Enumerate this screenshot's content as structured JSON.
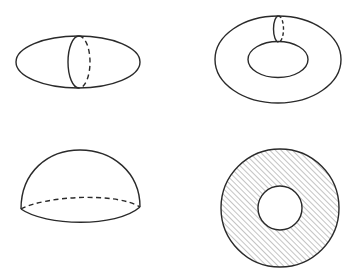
{
  "figure": {
    "background": "#ffffff",
    "line_color": "#2a2a2a",
    "hatch_color": "#8a8a8a",
    "panels": [
      {
        "id": "ellipsoid",
        "label": "ellipsoid",
        "outer_ellipse": {
          "cx": 78,
          "cy": 62,
          "rx": 62,
          "ry": 26
        },
        "meridian": {
          "cx": 79,
          "cy": 62,
          "rx": 11,
          "ry": 26,
          "front": "solid-left",
          "back": "dashed-right"
        }
      },
      {
        "id": "torus",
        "label": "torus",
        "outer_ellipse": {
          "cx": 278,
          "cy": 59.5,
          "rx": 63,
          "ry": 43.5
        },
        "inner_ellipse": {
          "cx": 278,
          "cy": 59.5,
          "rx": 30,
          "ry": 18
        },
        "meridian": {
          "cx": 278.5,
          "cy": 29,
          "rx": 5,
          "ry": 13,
          "front": "solid-left",
          "back": "dashed-right"
        }
      },
      {
        "id": "hemisphere",
        "label": "hemisphere",
        "dome": {
          "x1": 21,
          "y1": 209,
          "x2": 140,
          "y2": 207,
          "top_y": 150
        },
        "base_front": "solid",
        "base_back": "dashed"
      },
      {
        "id": "annulus",
        "label": "annulus",
        "outer_circle": {
          "cx": 280,
          "cy": 208,
          "r": 59
        },
        "inner_circle": {
          "cx": 280,
          "cy": 208,
          "r": 22
        },
        "fill": "diagonal-hatch"
      }
    ]
  }
}
